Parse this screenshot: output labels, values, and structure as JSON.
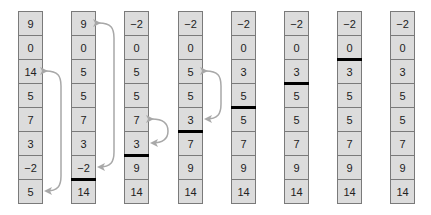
{
  "diagram": {
    "columns": [
      {
        "values": [
          "9",
          "0",
          "14",
          "5",
          "7",
          "3",
          "−2",
          "5"
        ],
        "sorted_bar_above_row": null,
        "swap_arrow": [
          2,
          7
        ]
      },
      {
        "values": [
          "9",
          "0",
          "5",
          "5",
          "7",
          "3",
          "−2",
          "14"
        ],
        "sorted_bar_above_row": 7,
        "swap_arrow": [
          0,
          6
        ]
      },
      {
        "values": [
          "−2",
          "0",
          "5",
          "5",
          "7",
          "3",
          "9",
          "14"
        ],
        "sorted_bar_above_row": 6,
        "swap_arrow": [
          4,
          5
        ]
      },
      {
        "values": [
          "−2",
          "0",
          "5",
          "5",
          "3",
          "7",
          "9",
          "14"
        ],
        "sorted_bar_above_row": 5,
        "swap_arrow": [
          2,
          4
        ]
      },
      {
        "values": [
          "−2",
          "0",
          "3",
          "5",
          "5",
          "7",
          "9",
          "14"
        ],
        "sorted_bar_above_row": 4,
        "swap_arrow": null
      },
      {
        "values": [
          "−2",
          "0",
          "3",
          "5",
          "5",
          "7",
          "9",
          "14"
        ],
        "sorted_bar_above_row": 3,
        "swap_arrow": null
      },
      {
        "values": [
          "−2",
          "0",
          "3",
          "5",
          "5",
          "7",
          "9",
          "14"
        ],
        "sorted_bar_above_row": 2,
        "swap_arrow": null
      },
      {
        "values": [
          "−2",
          "0",
          "3",
          "5",
          "5",
          "7",
          "9",
          "14"
        ],
        "sorted_bar_above_row": null,
        "swap_arrow": null
      }
    ],
    "colors": {
      "cell_fill": "#dcdcdc",
      "cell_border": "#7a7a7a",
      "bar": "#000000",
      "arrow": "#aaaaaa",
      "text": "#222222"
    }
  }
}
